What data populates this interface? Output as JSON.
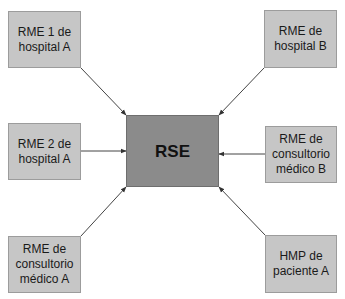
{
  "diagram": {
    "center": {
      "id": "rse",
      "label": "RSE",
      "x": 126,
      "y": 115,
      "w": 93,
      "h": 72
    },
    "nodes": [
      {
        "id": "rme1-hospital-a",
        "label": "RME 1 de\nhospital A",
        "x": 8,
        "y": 11,
        "w": 73,
        "h": 57
      },
      {
        "id": "rme-hospital-b",
        "label": "RME de\nhospital B",
        "x": 264,
        "y": 10,
        "w": 73,
        "h": 58
      },
      {
        "id": "rme2-hospital-a",
        "label": "RME 2 de\nhospital A",
        "x": 8,
        "y": 123,
        "w": 73,
        "h": 57
      },
      {
        "id": "rme-consultorio-b",
        "label": "RME de\nconsultorio\nmédico B",
        "x": 265,
        "y": 126,
        "w": 72,
        "h": 57
      },
      {
        "id": "rme-consultorio-a",
        "label": "RME de\nconsultorio\nmédico A",
        "x": 8,
        "y": 236,
        "w": 73,
        "h": 57
      },
      {
        "id": "hmp-paciente-a",
        "label": "HMP de\npaciente A",
        "x": 265,
        "y": 235,
        "w": 72,
        "h": 58
      }
    ],
    "edges": [
      {
        "from": "rme1-hospital-a",
        "to": "rse",
        "x1": 81,
        "y1": 68,
        "x2": 126,
        "y2": 115
      },
      {
        "from": "rme-hospital-b",
        "to": "rse",
        "x1": 264,
        "y1": 68,
        "x2": 219,
        "y2": 115
      },
      {
        "from": "rme2-hospital-a",
        "to": "rse",
        "x1": 81,
        "y1": 151,
        "x2": 126,
        "y2": 151
      },
      {
        "from": "rme-consultorio-b",
        "to": "rse",
        "x1": 265,
        "y1": 154,
        "x2": 219,
        "y2": 154
      },
      {
        "from": "rme-consultorio-a",
        "to": "rse",
        "x1": 81,
        "y1": 236,
        "x2": 126,
        "y2": 187
      },
      {
        "from": "hmp-paciente-a",
        "to": "rse",
        "x1": 265,
        "y1": 235,
        "x2": 219,
        "y2": 187
      }
    ],
    "colors": {
      "outer_fill": "#c6c6c6",
      "center_fill": "#8b8b8b",
      "edge": "#444444"
    }
  }
}
